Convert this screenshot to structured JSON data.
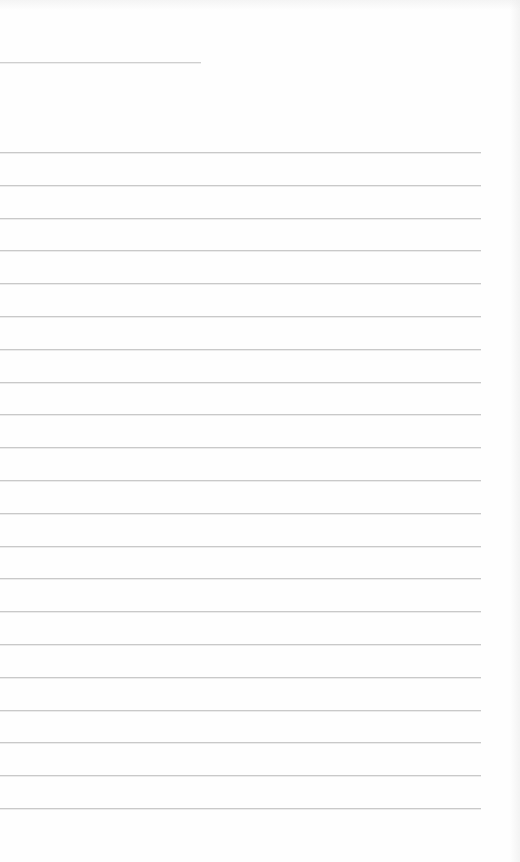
{
  "page": {
    "kind": "blank lined paper",
    "background_color": "#fefefe",
    "line_color": "#c9c9c9",
    "header_rule": {
      "y": 62,
      "x_start": 0,
      "x_end": 201
    },
    "rules": {
      "count": 21,
      "first_y": 152,
      "spacing": 32.8,
      "x_start": 0,
      "x_end": 481
    }
  }
}
